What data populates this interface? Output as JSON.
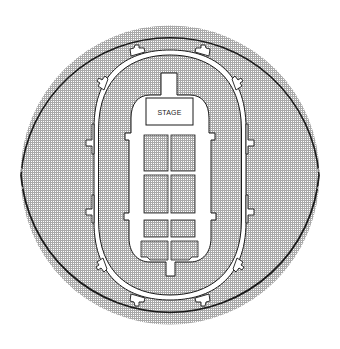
{
  "diagram": {
    "type": "arena-seating-map",
    "canvas": {
      "width": 340,
      "height": 349
    },
    "colors": {
      "background": "#ffffff",
      "stroke": "#1a1a1a",
      "pattern_dot": "#8a8a8a",
      "pattern_bg": "#ffffff",
      "aisle": "#ffffff"
    },
    "labels": {
      "stage": "STAGE"
    },
    "regions": [
      {
        "id": "outer-bowl",
        "description": "circular seating bowl (stippled)"
      },
      {
        "id": "concourse-ring",
        "description": "oval walkway ring with entry portals"
      },
      {
        "id": "lower-bowl",
        "description": "stippled seating between concourse and floor"
      },
      {
        "id": "floor",
        "description": "floor area with stage and seating blocks"
      },
      {
        "id": "stage",
        "description": "stage rectangle at north end of floor"
      }
    ],
    "floor_sections": [
      {
        "id": "F-A1",
        "row": 1,
        "col": "left"
      },
      {
        "id": "F-A2",
        "row": 1,
        "col": "right"
      },
      {
        "id": "F-B1",
        "row": 2,
        "col": "left"
      },
      {
        "id": "F-B2",
        "row": 2,
        "col": "right"
      },
      {
        "id": "F-C1",
        "row": 3,
        "col": "left"
      },
      {
        "id": "F-C2",
        "row": 3,
        "col": "right"
      },
      {
        "id": "F-D1",
        "row": 4,
        "col": "left"
      },
      {
        "id": "F-D2",
        "row": 4,
        "col": "right"
      }
    ],
    "portals_count": 12
  }
}
